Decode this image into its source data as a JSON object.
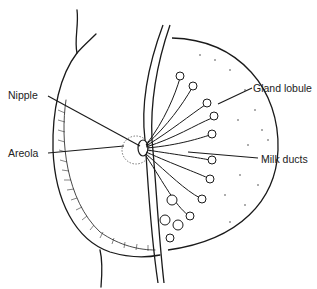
{
  "diagram": {
    "type": "anatomical illustration",
    "labels": [
      {
        "id": "nipple",
        "text": "Nipple",
        "x": 8,
        "y": 89
      },
      {
        "id": "areola",
        "text": "Areola",
        "x": 8,
        "y": 147
      },
      {
        "id": "gland-lobule",
        "text": "Gland lobule",
        "x": 253,
        "y": 82
      },
      {
        "id": "milk-ducts",
        "text": "Milk ducts",
        "x": 261,
        "y": 153
      }
    ],
    "colors": {
      "line": "#1a1a1a",
      "background": "#ffffff"
    }
  }
}
